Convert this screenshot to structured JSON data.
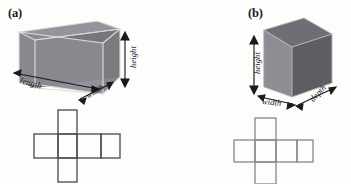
{
  "figure": {
    "background_color": "#fdfdfc",
    "panels": [
      {
        "id": "a",
        "label": "(a)",
        "shape_name": "rectangular-prism",
        "shape_style": "transparent-wireframe-shaded",
        "colors": {
          "top_face": "#8f9095",
          "front_face": "#8a8b90",
          "side_face": "#6f7075",
          "interior_face": "#7b7c81",
          "edge": "#d9d9dc",
          "net_stroke": "#4d4d52",
          "arrow": "#1a1a1a"
        },
        "dimension_labels": [
          {
            "name": "length",
            "text": "length",
            "rotation_deg": 15
          },
          {
            "name": "width",
            "text": "width",
            "rotation_deg": -32
          },
          {
            "name": "height",
            "text": "height",
            "rotation_deg": -90
          }
        ],
        "net": {
          "name": "cross-net-rectangular-prism",
          "description": "cross-shaped net of six rectangular faces",
          "face_count": 6,
          "stroke_color": "#4d4d52"
        }
      },
      {
        "id": "b",
        "label": "(b)",
        "shape_name": "cube",
        "shape_style": "solid-shaded",
        "colors": {
          "top_face": "#6e6f74",
          "front_face": "#8d8e93",
          "side_face": "#5d5e63",
          "edge": "#b9babe",
          "net_stroke": "#87888d",
          "arrow": "#1a1a1a"
        },
        "dimension_labels": [
          {
            "name": "height",
            "text": "height",
            "rotation_deg": -90
          },
          {
            "name": "width",
            "text": "width",
            "rotation_deg": 6
          },
          {
            "name": "depth",
            "text": "depth",
            "rotation_deg": -47
          }
        ],
        "net": {
          "name": "cross-net-cube",
          "description": "cross-shaped net of six square faces",
          "face_count": 6,
          "stroke_color": "#87888d"
        }
      }
    ]
  }
}
